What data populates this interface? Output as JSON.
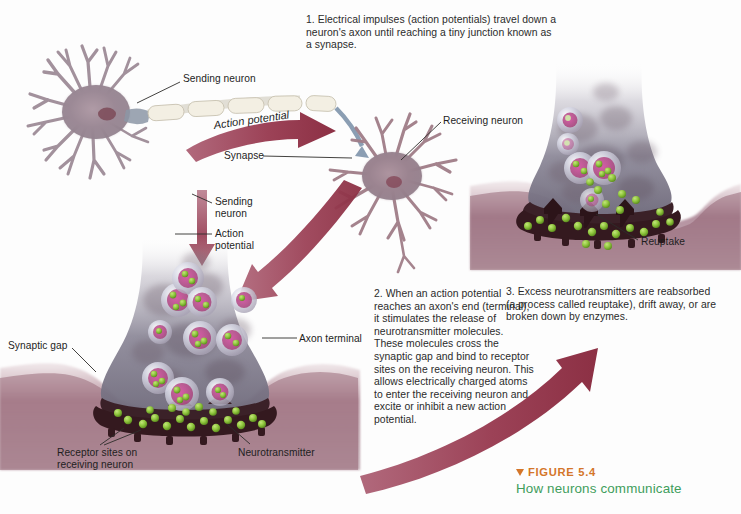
{
  "figure": {
    "marker_icon": "down-triangle-icon",
    "number_label": "FIGURE 5.4",
    "title": "How neurons communicate",
    "number_color": "#d4762a",
    "title_color": "#3f9e5c"
  },
  "captions": [
    {
      "id": "step-1",
      "text": "1. Electrical impulses (action potentials) travel down a neuron's axon until reaching a tiny junction known as a synapse."
    },
    {
      "id": "step-2",
      "text": "2. When an action potential reaches an axon's end (terminal), it stimulates the release of neurotransmitter molecules. These molecules cross the synaptic gap and bind to receptor sites on the receiving neuron. This allows electrically charged atoms to enter the receiving neuron and excite or inhibit a new action potential."
    },
    {
      "id": "step-3",
      "text": "3. Excess neurotransmitters are reabsorbed (a process called reuptake), drift away, or are broken down by enzymes."
    }
  ],
  "callouts": {
    "sending_neuron_top": "Sending neuron",
    "action_potential_top": "Action potential",
    "synapse": "Synapse",
    "receiving_neuron": "Receiving neuron",
    "sending_neuron_mid": "Sending\nneuron",
    "action_potential_mid": "Action\npotential",
    "axon_terminal": "Axon terminal",
    "synaptic_gap": "Synaptic gap",
    "receptor_sites": "Receptor sites on\nreceiving neuron",
    "neurotransmitter": "Neurotransmitter",
    "reuptake": "Reuptake"
  },
  "colors": {
    "arrow_maroon": "#9e4458",
    "arrow_maroon_light": "#b9697c",
    "terminal_body": "#8d8a99",
    "terminal_body_dark": "#6d6574",
    "membrane_dark": "#3a1f26",
    "membrane_tissue": "#9c6f7c",
    "vesicle_rim": "#c4c7d6",
    "vesicle_core": "#b0366f",
    "neurotransmitter_green": "#8cc63f",
    "neuron_body": "#9b8894",
    "axon_sheath": "#efeade",
    "leader_line": "#33312f"
  }
}
